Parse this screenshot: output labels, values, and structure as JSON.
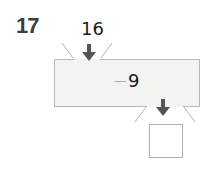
{
  "problem": {
    "number": "17",
    "input_value": "16",
    "operation": {
      "operator": "−",
      "operand": "9"
    },
    "output_value": ""
  },
  "icons": {
    "input_arrow": "arrow-down-icon",
    "output_arrow": "arrow-down-icon"
  },
  "colors": {
    "arrow": "#555555",
    "machine_fill": "#f3f3f2",
    "machine_border": "#b8b8b8",
    "text": "#1a1a1a",
    "number_label": "#3d3d3d"
  }
}
